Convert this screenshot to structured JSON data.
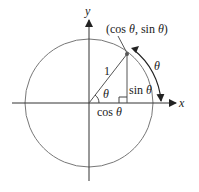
{
  "diagram": {
    "type": "unit-circle",
    "labels": {
      "x_axis": "x",
      "y_axis": "y",
      "point": "(cos θ, sin θ)",
      "point_cos": "cos",
      "point_sin": "sin",
      "theta": "θ",
      "radius": "1",
      "cos_label": "cos",
      "sin_label": "sin",
      "arc_theta": "θ",
      "angle_theta": "θ"
    },
    "colors": {
      "line": "#333333",
      "circle": "#666666",
      "text": "#222222"
    }
  }
}
